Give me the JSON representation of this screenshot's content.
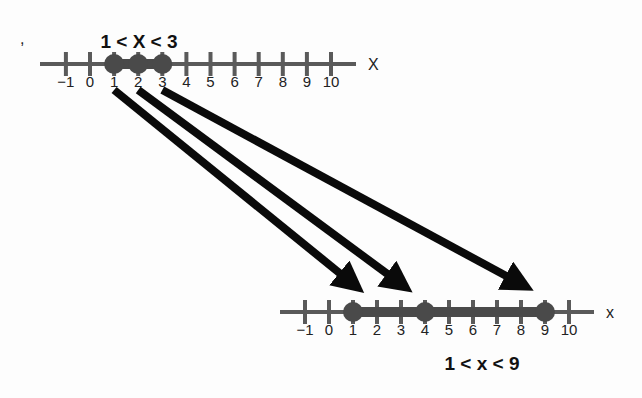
{
  "stray_mark": ",",
  "top_line": {
    "label": "1 < X < 3",
    "axis_name": "X",
    "ticks": [
      -1,
      0,
      1,
      2,
      3,
      4,
      5,
      6,
      7,
      8,
      9,
      10
    ],
    "tick_labels": [
      "−1",
      "0",
      "1",
      "2",
      "3",
      "4",
      "5",
      "6",
      "7",
      "8",
      "9",
      "10"
    ],
    "interval": [
      1,
      3
    ],
    "points": [
      1,
      2,
      3
    ]
  },
  "bottom_line": {
    "label": "1 < x < 9",
    "axis_name": "x",
    "ticks": [
      -1,
      0,
      1,
      2,
      3,
      4,
      5,
      6,
      7,
      8,
      9,
      10
    ],
    "tick_labels": [
      "−1",
      "0",
      "1",
      "2",
      "3",
      "4",
      "5",
      "6",
      "7",
      "8",
      "9",
      "10"
    ],
    "interval": [
      1,
      9
    ],
    "points": [
      1,
      4,
      9
    ]
  },
  "mappings": [
    {
      "from": 1,
      "to": 1
    },
    {
      "from": 2,
      "to": 3
    },
    {
      "from": 3,
      "to": 8
    }
  ],
  "colors": {
    "line": "#5a5a5a",
    "point": "#4a4a4a",
    "arrow": "#0a0a0a",
    "text": "#1a1a1a"
  }
}
